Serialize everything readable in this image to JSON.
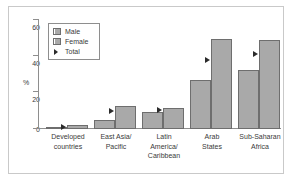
{
  "chart_data": {
    "type": "bar",
    "title": "",
    "subtitle": "",
    "xlabel": "",
    "ylabel": "%",
    "ylim": [
      0,
      60
    ],
    "yticks": [
      0,
      20,
      40,
      60
    ],
    "grid": false,
    "legend_position": "top-left-inside",
    "categories": [
      "Developed countries",
      "East Asia/ Pacific",
      "Latin America/ Caribbean",
      "Arab States",
      "Sub-Saharan Africa"
    ],
    "category_lines": [
      [
        "Developed",
        "countries"
      ],
      [
        "East Asia/",
        "Pacific"
      ],
      [
        "Latin",
        "America/",
        "Caribbean"
      ],
      [
        "Arab",
        "States"
      ],
      [
        "Sub-Saharan",
        "Africa"
      ]
    ],
    "series": [
      {
        "name": "Male",
        "values": [
          1,
          5,
          9.5,
          27,
          32
        ]
      },
      {
        "name": "Female",
        "values": [
          2,
          12.5,
          11.5,
          49,
          48.5
        ]
      },
      {
        "name": "Total",
        "values": [
          1.5,
          10,
          10.5,
          38,
          41
        ]
      }
    ],
    "legend": [
      {
        "label": "Male",
        "marker": "square-swatch"
      },
      {
        "label": "Female",
        "marker": "square-swatch"
      },
      {
        "label": "Total",
        "marker": "triangle-right"
      }
    ],
    "colors": {
      "bar_fill": "#a9a9a9",
      "bar_edge": "#6e6e6e",
      "axis": "#8e8e8e",
      "text": "#3a3a3a",
      "marker": "#2b2b2b",
      "frame": "#c9c9c9",
      "background": "#ffffff"
    }
  }
}
